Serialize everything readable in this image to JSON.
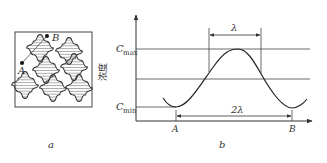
{
  "panel_a": {
    "caption": "a",
    "point_a": "A",
    "point_b": "B"
  },
  "panel_b": {
    "caption": "b",
    "y_label": "浓度",
    "cmax_main": "C",
    "cmax_sub": "max",
    "cmin_main": "C",
    "cmin_sub": "min",
    "lambda_label": "λ",
    "two_lambda_label": "2λ",
    "x_point_a": "A",
    "x_point_b": "B"
  },
  "colors": {
    "line": "#3a3a3a",
    "hatch": "#555555",
    "background": "#ffffff"
  }
}
